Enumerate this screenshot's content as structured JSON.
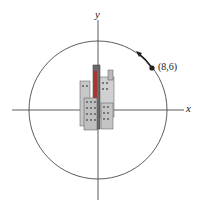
{
  "diagram": {
    "axes": {
      "x_label": "x",
      "y_label": "y"
    },
    "point": {
      "label": "(8,6)",
      "x": 8,
      "y": 6
    },
    "circle": {
      "radius": 10,
      "center": "origin"
    },
    "motion": {
      "direction": "counterclockwise"
    },
    "illustration": "city-buildings"
  }
}
